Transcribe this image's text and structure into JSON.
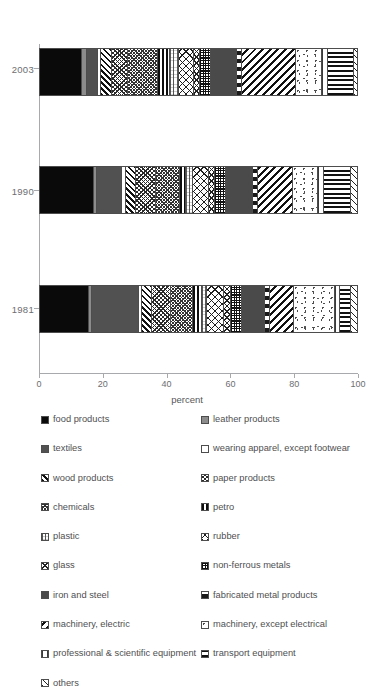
{
  "chart_data": {
    "type": "bar",
    "orientation": "horizontal",
    "stacked": true,
    "title": "",
    "xlabel": "percent",
    "ylabel": "",
    "xlim": [
      0,
      100
    ],
    "xticks": [
      "0",
      "20",
      "40",
      "60",
      "80",
      "100"
    ],
    "grid": false,
    "legend_position": "bottom",
    "categories": [
      "2003",
      "1990",
      "1981"
    ],
    "series": [
      {
        "name": "food products",
        "key": "food",
        "values": [
          13.0,
          17.0,
          15.5
        ]
      },
      {
        "name": "leather products",
        "key": "leather",
        "values": [
          1.8,
          1.0,
          1.0
        ]
      },
      {
        "name": "textiles",
        "key": "textiles",
        "values": [
          3.2,
          8.0,
          15.0
        ]
      },
      {
        "name": "wearing apparel, except footwear",
        "key": "apparel",
        "values": [
          1.0,
          1.2,
          1.0
        ]
      },
      {
        "name": "wood products",
        "key": "wood",
        "values": [
          3.5,
          3.0,
          3.0
        ]
      },
      {
        "name": "paper products",
        "key": "paper",
        "values": [
          5.0,
          6.5,
          6.0
        ]
      },
      {
        "name": "chemicals",
        "key": "chemicals",
        "values": [
          9.5,
          7.5,
          7.0
        ]
      },
      {
        "name": "petro",
        "key": "petro",
        "values": [
          3.5,
          2.0,
          3.0
        ]
      },
      {
        "name": "plastic",
        "key": "plastic",
        "values": [
          3.0,
          2.0,
          1.5
        ]
      },
      {
        "name": "rubber",
        "key": "rubber",
        "values": [
          4.5,
          5.0,
          5.5
        ]
      },
      {
        "name": "glass",
        "key": "glass",
        "values": [
          2.0,
          2.0,
          2.0
        ]
      },
      {
        "name": "non-ferrous metals",
        "key": "nonferrous",
        "values": [
          3.5,
          3.5,
          3.5
        ]
      },
      {
        "name": "iron and steel",
        "key": "iron",
        "values": [
          8.0,
          8.5,
          7.5
        ]
      },
      {
        "name": "fabricated metal products",
        "key": "fabmetal",
        "values": [
          1.5,
          1.5,
          1.5
        ]
      },
      {
        "name": "machinery, electric",
        "key": "machelec",
        "values": [
          17.0,
          11.0,
          7.5
        ]
      },
      {
        "name": "machinery, except electrical",
        "key": "machexcept",
        "values": [
          8.0,
          8.0,
          13.0
        ]
      },
      {
        "name": "professional & scientific equipment",
        "key": "profsci",
        "values": [
          2.0,
          2.0,
          1.5
        ]
      },
      {
        "name": "transport equipment",
        "key": "transport",
        "values": [
          8.0,
          8.5,
          3.5
        ]
      },
      {
        "name": "others",
        "key": "others",
        "values": [
          1.0,
          1.8,
          2.0
        ]
      }
    ]
  },
  "axis": {
    "x_title": "percent",
    "x_ticks": [
      "0",
      "20",
      "40",
      "60",
      "80",
      "100"
    ],
    "y_ticks": [
      "2003",
      "1990",
      "1981"
    ]
  },
  "legend": {
    "left_column": [
      {
        "label": "food products",
        "pattern": "solid-black"
      },
      {
        "label": "textiles",
        "pattern": "solid-dark-gray"
      },
      {
        "label": "wood products",
        "pattern": "diagonal-hatch"
      },
      {
        "label": "chemicals",
        "pattern": "cross-hatch-fine"
      },
      {
        "label": "plastic",
        "pattern": "light-vertical-dots"
      },
      {
        "label": "glass",
        "pattern": "diagonal-cross"
      },
      {
        "label": "iron and steel",
        "pattern": "sparse-ellipses"
      },
      {
        "label": "machinery, electric",
        "pattern": "diagonal-back-hatch"
      },
      {
        "label": "professional & scientific equipment",
        "pattern": "fine-vertical-lines"
      },
      {
        "label": "others",
        "pattern": "sparse-diagonal"
      }
    ],
    "right_column": [
      {
        "label": "leather products",
        "pattern": "solid-gray"
      },
      {
        "label": "wearing apparel, except footwear",
        "pattern": "empty-white"
      },
      {
        "label": "paper products",
        "pattern": "half-diagonal"
      },
      {
        "label": "petro",
        "pattern": "vertical-bars"
      },
      {
        "label": "rubber",
        "pattern": "coarse-cross"
      },
      {
        "label": "non-ferrous metals",
        "pattern": "grid-dense"
      },
      {
        "label": "fabricated metal products",
        "pattern": "horizontal-bars"
      },
      {
        "label": "machinery, except electrical",
        "pattern": "stipple-dots"
      },
      {
        "label": "transport equipment",
        "pattern": "horizontal-lines"
      }
    ]
  }
}
